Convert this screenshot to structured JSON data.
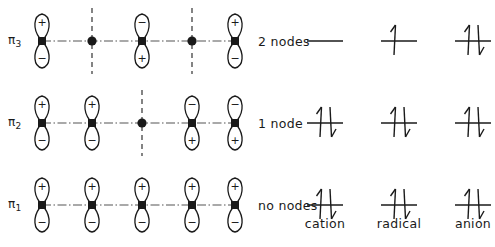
{
  "figure": {
    "ink_color": "#1a1a1a",
    "node_line_color": "#333333"
  },
  "orbital_rows": [
    {
      "id": "pi3",
      "label_pi": "π",
      "label_sub": "3",
      "node_text": "2 nodes",
      "node_count": 2,
      "sites": [
        {
          "index": 1,
          "type": "orbital",
          "top_sign": "+",
          "bottom_sign": "−"
        },
        {
          "index": 2,
          "type": "node"
        },
        {
          "index": 3,
          "type": "orbital",
          "top_sign": "−",
          "bottom_sign": "+"
        },
        {
          "index": 4,
          "type": "node"
        },
        {
          "index": 5,
          "type": "orbital",
          "top_sign": "+",
          "bottom_sign": "−"
        }
      ]
    },
    {
      "id": "pi2",
      "label_pi": "π",
      "label_sub": "2",
      "node_text": "1 node",
      "node_count": 1,
      "sites": [
        {
          "index": 1,
          "type": "orbital",
          "top_sign": "+",
          "bottom_sign": "−"
        },
        {
          "index": 2,
          "type": "orbital",
          "top_sign": "+",
          "bottom_sign": "−"
        },
        {
          "index": 3,
          "type": "node"
        },
        {
          "index": 4,
          "type": "orbital",
          "top_sign": "−",
          "bottom_sign": "+"
        },
        {
          "index": 5,
          "type": "orbital",
          "top_sign": "−",
          "bottom_sign": "+"
        }
      ]
    },
    {
      "id": "pi1",
      "label_pi": "π",
      "label_sub": "1",
      "node_text": "no nodes",
      "node_count": 0,
      "sites": [
        {
          "index": 1,
          "type": "orbital",
          "top_sign": "+",
          "bottom_sign": "−"
        },
        {
          "index": 2,
          "type": "orbital",
          "top_sign": "+",
          "bottom_sign": "−"
        },
        {
          "index": 3,
          "type": "orbital",
          "top_sign": "+",
          "bottom_sign": "−"
        },
        {
          "index": 4,
          "type": "orbital",
          "top_sign": "+",
          "bottom_sign": "−"
        },
        {
          "index": 5,
          "type": "orbital",
          "top_sign": "+",
          "bottom_sign": "−"
        }
      ]
    }
  ],
  "species_columns": [
    {
      "id": "cation",
      "label": "cation"
    },
    {
      "id": "radical",
      "label": "radical"
    },
    {
      "id": "anion",
      "label": "anion"
    }
  ],
  "electron_configuration": {
    "pi3": {
      "cation": 0,
      "radical": 1,
      "anion": 2
    },
    "pi2": {
      "cation": 2,
      "radical": 2,
      "anion": 2
    },
    "pi1": {
      "cation": 2,
      "radical": 2,
      "anion": 2
    }
  }
}
